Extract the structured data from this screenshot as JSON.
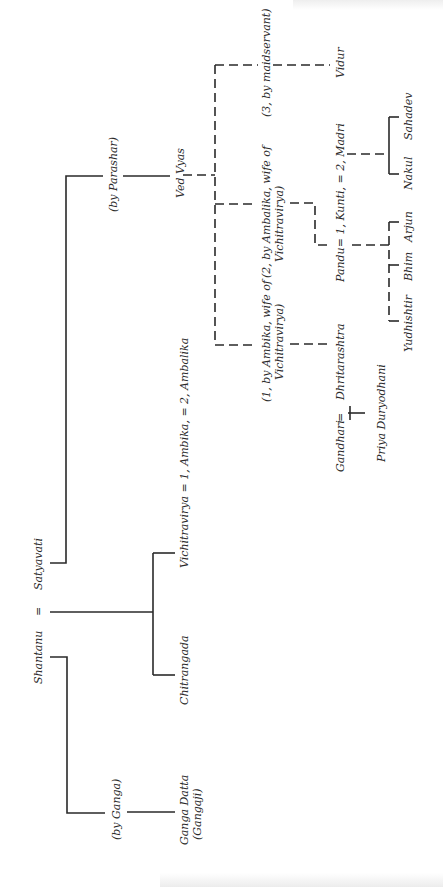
{
  "diagram": {
    "type": "family-tree",
    "orientation": "rotated-90-ccw",
    "line_color": "#2a2a2a",
    "background": "#ffffff",
    "people": {
      "shantanu": "Shantanu",
      "equals_1": "=",
      "satyavati": "Satyavati",
      "by_ganga": "(by Ganga)",
      "ganga_datta_1": "Ganga Datta",
      "ganga_datta_2": "(Gangaji)",
      "chitrangada": "Chitrangada",
      "vichitravirya_line": "Vichitravirya = 1, Ambika, = 2, Ambalika",
      "by_parashar": "(by Parashar)",
      "ved_vyas": "Ved Vyas",
      "by_ambika_1": "(1, by Ambika, wife of",
      "by_ambika_2": "Vichitravirya)",
      "by_ambalika_1": "(2, by Ambalika, wife of",
      "by_ambalika_2": "Vichitravirya)",
      "by_maidservant": "(3, by maidservant)",
      "vidur": "Vidur",
      "dhritarashtra": "Dhritarashtra",
      "gandhari": "Gandhari",
      "equals_2": "=",
      "priya_duryodhani": "Priya Duryodhani",
      "pandu_line": "Pandu= 1, Kunti, = 2, Madri",
      "yudhishtir": "Yudhishtir",
      "bhim": "Bhim",
      "arjun": "Arjun",
      "nakul": "Nakul",
      "sahadev": "Sahadev"
    }
  }
}
